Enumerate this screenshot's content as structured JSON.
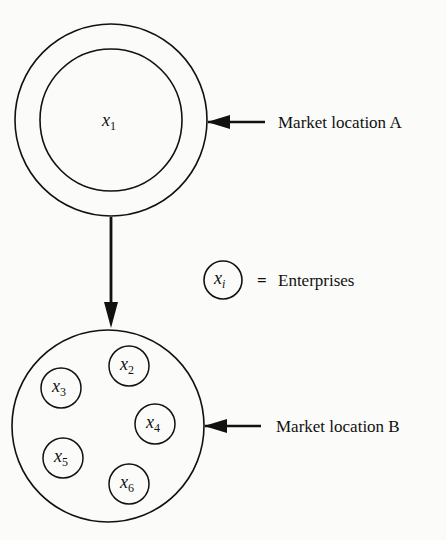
{
  "diagram": {
    "market_a": {
      "label": "Market location A",
      "enterprise": {
        "var": "x",
        "sub": "1"
      }
    },
    "market_b": {
      "label": "Market location B",
      "enterprises": [
        {
          "var": "x",
          "sub": "2"
        },
        {
          "var": "x",
          "sub": "3"
        },
        {
          "var": "x",
          "sub": "4"
        },
        {
          "var": "x",
          "sub": "5"
        },
        {
          "var": "x",
          "sub": "6"
        }
      ]
    },
    "legend": {
      "var": "x",
      "sub": "i",
      "equals": "=",
      "text": "Enterprises"
    }
  }
}
